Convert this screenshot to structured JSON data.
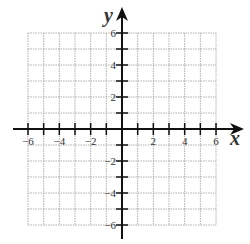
{
  "chart_data": {
    "type": "scatter",
    "title": "",
    "xlabel": "x",
    "ylabel": "y",
    "xlim": [
      -6,
      6
    ],
    "ylim": [
      -6,
      6
    ],
    "grid": true,
    "grid_step": 1,
    "x_ticks": [
      -6,
      -5,
      -4,
      -3,
      -2,
      -1,
      1,
      2,
      3,
      4,
      5,
      6
    ],
    "y_ticks": [
      -6,
      -5,
      -4,
      -3,
      -2,
      -1,
      1,
      2,
      3,
      4,
      5,
      6
    ],
    "x_tick_labels": [
      "-6",
      "-4",
      "-2",
      "2",
      "4",
      "6"
    ],
    "y_tick_labels": [
      "6",
      "4",
      "2",
      "-2",
      "-4",
      "-6"
    ],
    "series": [],
    "legend": null
  },
  "axes": {
    "x_label": "x",
    "y_label": "y",
    "x_tick_labels": [
      {
        "value": -6,
        "text": "−6"
      },
      {
        "value": -4,
        "text": "−4"
      },
      {
        "value": -2,
        "text": "−2"
      },
      {
        "value": 2,
        "text": "2"
      },
      {
        "value": 4,
        "text": "4"
      },
      {
        "value": 6,
        "text": "6"
      }
    ],
    "y_tick_labels": [
      {
        "value": 6,
        "text": "6"
      },
      {
        "value": 4,
        "text": "4"
      },
      {
        "value": 2,
        "text": "2"
      },
      {
        "value": -2,
        "text": "−2"
      },
      {
        "value": -4,
        "text": "−4"
      },
      {
        "value": -6,
        "text": "−6"
      }
    ]
  },
  "colors": {
    "grid": "#9a9a9a",
    "axis": "#111111",
    "label": "#333333"
  }
}
